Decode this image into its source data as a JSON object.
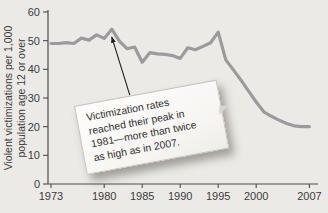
{
  "figure": {
    "background": "#eceae7",
    "line_color": "#9b9b9b",
    "axis_color": "#4c4c4c",
    "text_color": "#3b3b3b",
    "arrow_color": "#1d1d1d"
  },
  "y_axis": {
    "label_line1": "Violent victimizations per 1,000",
    "label_line2": "population age 12 or over",
    "ticks": [
      0,
      10,
      20,
      30,
      40,
      50,
      60
    ],
    "min": 0,
    "max": 60
  },
  "x_axis": {
    "tick_years": [
      1973,
      1980,
      1985,
      1990,
      1995,
      2000,
      2007
    ],
    "min": 1973,
    "max": 2007
  },
  "annotation": {
    "text": "Victimization rates reached their peak in 1981—more than twice as high as in 2007.",
    "lines": [
      "Victimization rates",
      "reached their peak in",
      "1981—more than twice",
      "as high as in 2007."
    ],
    "arrow_target_year": 1981,
    "arrow_target_value": 54
  },
  "chart_data": {
    "type": "line",
    "title": "",
    "xlabel": "",
    "ylabel": "Violent victimizations per 1,000 population age 12 or over",
    "ylim": [
      0,
      60
    ],
    "xlim": [
      1973,
      2007
    ],
    "grid": false,
    "legend": "none",
    "xticks": [
      1973,
      1980,
      1985,
      1990,
      1995,
      2000,
      2007
    ],
    "yticks": [
      0,
      10,
      20,
      30,
      40,
      50,
      60
    ],
    "annotation": "Victimization rates reached their peak in 1981—more than twice as high as in 2007.",
    "x": [
      1973,
      1974,
      1975,
      1976,
      1977,
      1978,
      1979,
      1980,
      1981,
      1982,
      1983,
      1984,
      1985,
      1986,
      1987,
      1988,
      1989,
      1990,
      1991,
      1992,
      1993,
      1994,
      1995,
      1996,
      1997,
      1998,
      1999,
      2000,
      2001,
      2002,
      2003,
      2004,
      2005,
      2006,
      2007
    ],
    "values": [
      49,
      49,
      49.3,
      49,
      50.9,
      50.2,
      52,
      50.8,
      54,
      49.8,
      47.2,
      47.8,
      42.5,
      45.8,
      45.4,
      45.2,
      44.8,
      43.8,
      47.5,
      46.8,
      48,
      49.3,
      53,
      43.3,
      39.8,
      36.2,
      32.4,
      28.6,
      25.2,
      23.6,
      22.3,
      21.1,
      20.3,
      20,
      20
    ],
    "series_name": "Violent victimization rate"
  }
}
